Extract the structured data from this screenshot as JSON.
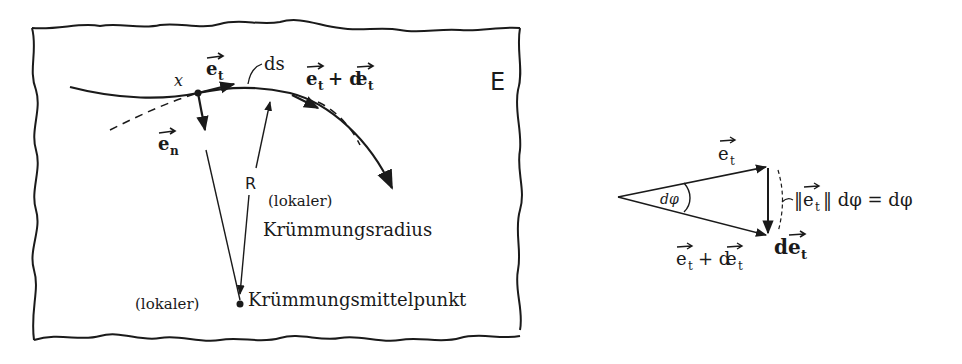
{
  "left_panel": {
    "frame_label": "E",
    "point_label": "x",
    "tangent_label": "e_t",
    "tangent_vec": "e",
    "tangent_sub": "t",
    "normal_vec": "e",
    "normal_sub": "n",
    "arc_label": "ds",
    "next_tangent_label": "e_t + de_t",
    "next_tangent_e": "e",
    "next_tangent_sub": "t",
    "next_tangent_plus": "+ d",
    "next_tangent_e2": "e",
    "next_tangent_sub2": "t",
    "radius_label": "R",
    "radius_desc_line1": "(lokaler)",
    "radius_desc_line2": "Krümmungsradius",
    "center_prefix": "(lokaler)",
    "center_label": "Krümmungsmittelpunkt"
  },
  "right_panel": {
    "top_vec": "e",
    "top_sub": "t",
    "angle_label": "dφ",
    "bottom_e": "e",
    "bottom_sub": "t",
    "bottom_plus": "+ d",
    "bottom_e2": "e",
    "bottom_sub2": "t",
    "diff_d": "d",
    "diff_e": "e",
    "diff_sub": "t",
    "magnitude_label": "‖e_t‖ dφ = dφ",
    "mag_open": "‖",
    "mag_e": "e",
    "mag_sub": "t",
    "mag_close": "‖ dφ = dφ"
  }
}
